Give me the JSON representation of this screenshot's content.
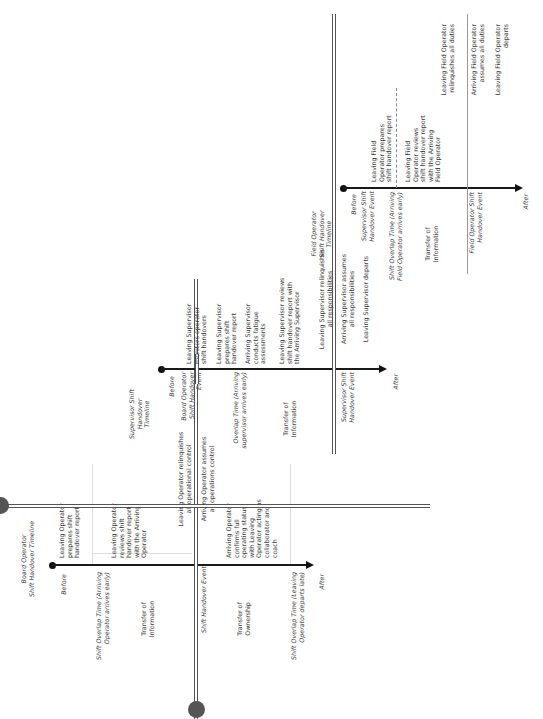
{
  "board": {
    "title": "Board Operator\nShift Handover Timeline",
    "before": "Before",
    "after": "After",
    "overlap_start": "Shift Overlap Time (Arriving\nOperator arrives early)",
    "overlap_end": "Shift Overlap Time (Leaving\nOperator departs late)",
    "transfer_info": "Transfer of\nInformation",
    "transfer_ownership": "Transfer of\nOwnership",
    "event": "Shift Handover Event",
    "steps": [
      "Leaving Operator\nprepares shift\nhandover report",
      "Leaving Operator\nreviews shift\nhandover report\nwith the Arriving\nOperator",
      "Leaving Operator relinquishes\nall operational control",
      "Arriving Operator assumes\nall operations control",
      "Arriving Operator\nconfirms full\noperating status\nwith Leaving\nOperator acting as\ncollaborator and\ncoach"
    ]
  },
  "supervisor": {
    "title": "Supervisor Shift\nHandover\nTimeline",
    "before": "Before",
    "after": "After",
    "board_event": "Board Operator\nShift Handover\nEvent",
    "overlap": "Overlap Time (Arriving\nsupervisor arrives early)",
    "transfer_info": "Transfer of\nInformation",
    "event": "Supervisor Shift\nHandover Event",
    "steps": [
      "Leaving Supervisor\nmonitors operator\nshift handovers",
      "Leaving Supervisor\nprepares shift\nhandover report",
      "Arriving Supervisor\nconducts fatigue\nassessments",
      "Leaving Supervisor reviews\nshift handover report with\nthe Arriving Supervisor",
      "Leaving Supervisor relinquishes\nall responsibilities",
      "Arriving Supervisor assumes\nall responsibilities",
      "Leaving Supervisor departs"
    ]
  },
  "field": {
    "title": "Field Operator\nShift Handover\nTimeline",
    "before": "Before",
    "after": "After",
    "supervisor_event": "Supervisor Shift\nHandover Event",
    "overlap": "Shift Overlap Time (Arriving\nField Operator arrives early)",
    "transfer_info": "Transfer of\nInformation",
    "event": "Field Operator Shift\nHandover Event",
    "steps": [
      "Leaving Field\nOperator prepares\nshift handover report",
      "Leaving Field\nOperator reviews\nshift handover report\nwith the Arriving\nField Operator",
      "Leaving Field Operator\nrelinquishes all duties",
      "Arriving Field Operator\nassumes all duties",
      "Leaving Field Operator\ndeparts"
    ]
  }
}
